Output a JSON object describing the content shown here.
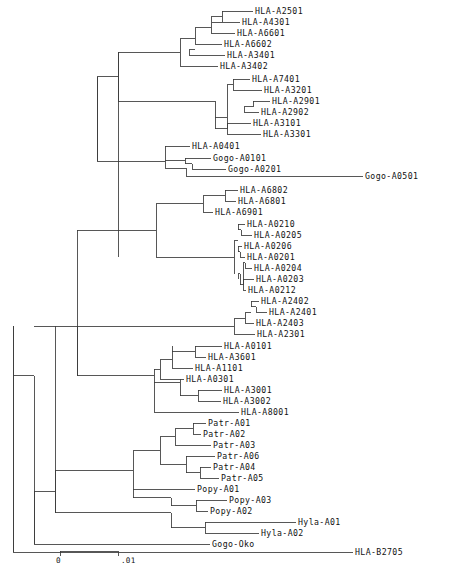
{
  "figure": {
    "type": "phylogenetic-tree",
    "title": "",
    "layout": "rectangular-cladogram",
    "orientation": "left-to-right",
    "line_color": "#3a3a3a",
    "text_color": "#111111",
    "background": "#ffffff",
    "width": 458,
    "height": 569
  },
  "scale_bar": {
    "start_label": "0",
    "end_label": ".01",
    "x_start": 60,
    "x_end": 118,
    "y": 551,
    "tick_height": 5
  },
  "tips": [
    {
      "label": "HLA-A2501",
      "x": 255,
      "y": 11
    },
    {
      "label": "HLA-A4301",
      "x": 242,
      "y": 22
    },
    {
      "label": "HLA-A6601",
      "x": 237,
      "y": 33
    },
    {
      "label": "HLA-A6602",
      "x": 224,
      "y": 44
    },
    {
      "label": "HLA-A3401",
      "x": 227,
      "y": 55
    },
    {
      "label": "HLA-A3402",
      "x": 220,
      "y": 66
    },
    {
      "label": "HLA-A7401",
      "x": 252,
      "y": 79
    },
    {
      "label": "HLA-A3201",
      "x": 264,
      "y": 90
    },
    {
      "label": "HLA-A2901",
      "x": 272,
      "y": 101
    },
    {
      "label": "HLA-A2902",
      "x": 261,
      "y": 112
    },
    {
      "label": "HLA-A3101",
      "x": 253,
      "y": 123
    },
    {
      "label": "HLA-A3301",
      "x": 263,
      "y": 134
    },
    {
      "label": "HLA-A0401",
      "x": 192,
      "y": 146
    },
    {
      "label": "Gogo-A0101",
      "x": 213,
      "y": 158
    },
    {
      "label": "Gogo-A0201",
      "x": 228,
      "y": 169
    },
    {
      "label": "Gogo-A0501",
      "x": 365,
      "y": 176
    },
    {
      "label": "HLA-A6802",
      "x": 240,
      "y": 190
    },
    {
      "label": "HLA-A6801",
      "x": 238,
      "y": 201
    },
    {
      "label": "HLA-A6901",
      "x": 215,
      "y": 212
    },
    {
      "label": "HLA-A0210",
      "x": 247,
      "y": 224
    },
    {
      "label": "HLA-A0205",
      "x": 254,
      "y": 235
    },
    {
      "label": "HLA-A0206",
      "x": 244,
      "y": 246
    },
    {
      "label": "HLA-A0201",
      "x": 247,
      "y": 257
    },
    {
      "label": "HLA-A0204",
      "x": 254,
      "y": 268
    },
    {
      "label": "HLA-A0203",
      "x": 256,
      "y": 279
    },
    {
      "label": "HLA-A0212",
      "x": 248,
      "y": 290
    },
    {
      "label": "HLA-A2402",
      "x": 261,
      "y": 301
    },
    {
      "label": "HLA-A2401",
      "x": 269,
      "y": 312
    },
    {
      "label": "HLA-A2403",
      "x": 256,
      "y": 323
    },
    {
      "label": "HLA-A2301",
      "x": 257,
      "y": 334
    },
    {
      "label": "HLA-A0101",
      "x": 224,
      "y": 346
    },
    {
      "label": "HLA-A3601",
      "x": 208,
      "y": 357
    },
    {
      "label": "HLA-A1101",
      "x": 195,
      "y": 368
    },
    {
      "label": "HLA-A0301",
      "x": 186,
      "y": 379
    },
    {
      "label": "HLA-A3001",
      "x": 224,
      "y": 390
    },
    {
      "label": "HLA-A3002",
      "x": 223,
      "y": 401
    },
    {
      "label": "HLA-A8001",
      "x": 241,
      "y": 412
    },
    {
      "label": "Patr-A01",
      "x": 208,
      "y": 423
    },
    {
      "label": "Patr-A02",
      "x": 203,
      "y": 434
    },
    {
      "label": "Patr-A03",
      "x": 213,
      "y": 445
    },
    {
      "label": "Patr-A06",
      "x": 217,
      "y": 456
    },
    {
      "label": "Patr-A04",
      "x": 213,
      "y": 467
    },
    {
      "label": "Patr-A05",
      "x": 221,
      "y": 478
    },
    {
      "label": "Popy-A01",
      "x": 197,
      "y": 489
    },
    {
      "label": "Popy-A03",
      "x": 229,
      "y": 500
    },
    {
      "label": "Popy-A02",
      "x": 210,
      "y": 511
    },
    {
      "label": "Hyla-A01",
      "x": 298,
      "y": 522
    },
    {
      "label": "Hyla-A02",
      "x": 261,
      "y": 533
    },
    {
      "label": "Gogo-Oko",
      "x": 212,
      "y": 544
    },
    {
      "label": "HLA-B2705",
      "x": 355,
      "y": 552
    }
  ],
  "branches": {
    "horizontal": [
      {
        "x1": 222,
        "x2": 253,
        "y": 11
      },
      {
        "x1": 212,
        "x2": 240,
        "y": 22
      },
      {
        "x1": 211,
        "x2": 235,
        "y": 33
      },
      {
        "x1": 195,
        "x2": 222,
        "y": 44
      },
      {
        "x1": 189,
        "x2": 225,
        "y": 55
      },
      {
        "x1": 180,
        "x2": 218,
        "y": 66
      },
      {
        "x1": 233,
        "x2": 250,
        "y": 79
      },
      {
        "x1": 233,
        "x2": 262,
        "y": 90
      },
      {
        "x1": 253,
        "x2": 270,
        "y": 101
      },
      {
        "x1": 244,
        "x2": 259,
        "y": 112
      },
      {
        "x1": 227,
        "x2": 251,
        "y": 123
      },
      {
        "x1": 227,
        "x2": 261,
        "y": 134
      },
      {
        "x1": 165,
        "x2": 190,
        "y": 146
      },
      {
        "x1": 185,
        "x2": 211,
        "y": 158
      },
      {
        "x1": 192,
        "x2": 226,
        "y": 169
      },
      {
        "x1": 186,
        "x2": 363,
        "y": 176
      },
      {
        "x1": 225,
        "x2": 238,
        "y": 190
      },
      {
        "x1": 225,
        "x2": 236,
        "y": 201
      },
      {
        "x1": 203,
        "x2": 213,
        "y": 212
      },
      {
        "x1": 238,
        "x2": 245,
        "y": 224
      },
      {
        "x1": 241,
        "x2": 252,
        "y": 235
      },
      {
        "x1": 238,
        "x2": 242,
        "y": 246
      },
      {
        "x1": 240,
        "x2": 245,
        "y": 257
      },
      {
        "x1": 245,
        "x2": 252,
        "y": 268
      },
      {
        "x1": 243,
        "x2": 254,
        "y": 279
      },
      {
        "x1": 243,
        "x2": 246,
        "y": 290
      },
      {
        "x1": 251,
        "x2": 259,
        "y": 301
      },
      {
        "x1": 256,
        "x2": 267,
        "y": 312
      },
      {
        "x1": 245,
        "x2": 254,
        "y": 323
      },
      {
        "x1": 234,
        "x2": 255,
        "y": 334
      },
      {
        "x1": 195,
        "x2": 222,
        "y": 346
      },
      {
        "x1": 195,
        "x2": 206,
        "y": 357
      },
      {
        "x1": 172,
        "x2": 193,
        "y": 368
      },
      {
        "x1": 160,
        "x2": 184,
        "y": 379
      },
      {
        "x1": 198,
        "x2": 222,
        "y": 390
      },
      {
        "x1": 198,
        "x2": 221,
        "y": 401
      },
      {
        "x1": 154,
        "x2": 239,
        "y": 412
      },
      {
        "x1": 193,
        "x2": 206,
        "y": 423
      },
      {
        "x1": 193,
        "x2": 201,
        "y": 434
      },
      {
        "x1": 175,
        "x2": 211,
        "y": 445
      },
      {
        "x1": 186,
        "x2": 215,
        "y": 456
      },
      {
        "x1": 200,
        "x2": 211,
        "y": 467
      },
      {
        "x1": 200,
        "x2": 219,
        "y": 478
      },
      {
        "x1": 133,
        "x2": 195,
        "y": 489
      },
      {
        "x1": 196,
        "x2": 227,
        "y": 500
      },
      {
        "x1": 196,
        "x2": 208,
        "y": 511
      },
      {
        "x1": 205,
        "x2": 296,
        "y": 522
      },
      {
        "x1": 205,
        "x2": 259,
        "y": 533
      },
      {
        "x1": 34,
        "x2": 210,
        "y": 544
      },
      {
        "x1": 13,
        "x2": 353,
        "y": 552
      },
      {
        "x1": 211,
        "x2": 222,
        "y": 16.5
      },
      {
        "x1": 195,
        "x2": 211,
        "y": 27.5
      },
      {
        "x1": 180,
        "x2": 195,
        "y": 38.5
      },
      {
        "x1": 189,
        "x2": 195,
        "y": 49.5
      },
      {
        "x1": 118,
        "x2": 180,
        "y": 52.25
      },
      {
        "x1": 227,
        "x2": 233,
        "y": 84.5
      },
      {
        "x1": 244,
        "x2": 253,
        "y": 106.5
      },
      {
        "x1": 215,
        "x2": 227,
        "y": 128.5
      },
      {
        "x1": 215,
        "x2": 227,
        "y": 117.5
      },
      {
        "x1": 118,
        "x2": 215,
        "y": 101.0
      },
      {
        "x1": 97,
        "x2": 118,
        "y": 76.6
      },
      {
        "x1": 185,
        "x2": 192,
        "y": 163.5
      },
      {
        "x1": 165,
        "x2": 185,
        "y": 160.75
      },
      {
        "x1": 165,
        "x2": 186,
        "y": 168.4
      },
      {
        "x1": 97,
        "x2": 165,
        "y": 161.0
      },
      {
        "x1": 203,
        "x2": 225,
        "y": 195.5
      },
      {
        "x1": 156,
        "x2": 203,
        "y": 203.75
      },
      {
        "x1": 238,
        "x2": 241,
        "y": 229.5
      },
      {
        "x1": 238,
        "x2": 240,
        "y": 251.5
      },
      {
        "x1": 243,
        "x2": 245,
        "y": 262.5
      },
      {
        "x1": 240,
        "x2": 243,
        "y": 284.5
      },
      {
        "x1": 238,
        "x2": 240,
        "y": 273.5
      },
      {
        "x1": 234,
        "x2": 238,
        "y": 240.5
      },
      {
        "x1": 156,
        "x2": 234,
        "y": 257.0
      },
      {
        "x1": 118,
        "x2": 156,
        "y": 230.4
      },
      {
        "x1": 251,
        "x2": 256,
        "y": 306.5
      },
      {
        "x1": 245,
        "x2": 251,
        "y": 312.75
      },
      {
        "x1": 234,
        "x2": 245,
        "y": 318.9
      },
      {
        "x1": 77,
        "x2": 234,
        "y": 326.4
      },
      {
        "x1": 172,
        "x2": 195,
        "y": 351.5
      },
      {
        "x1": 160,
        "x2": 172,
        "y": 359.75
      },
      {
        "x1": 154,
        "x2": 160,
        "y": 369.4
      },
      {
        "x1": 180,
        "x2": 198,
        "y": 395.5
      },
      {
        "x1": 154,
        "x2": 180,
        "y": 382.4
      },
      {
        "x1": 77,
        "x2": 154,
        "y": 375.9
      },
      {
        "x1": 175,
        "x2": 193,
        "y": 428.5
      },
      {
        "x1": 160,
        "x2": 175,
        "y": 436.75
      },
      {
        "x1": 186,
        "x2": 200,
        "y": 472.5
      },
      {
        "x1": 160,
        "x2": 186,
        "y": 464.25
      },
      {
        "x1": 133,
        "x2": 160,
        "y": 450.5
      },
      {
        "x1": 55,
        "x2": 133,
        "y": 470.0
      },
      {
        "x1": 171,
        "x2": 196,
        "y": 505.5
      },
      {
        "x1": 133,
        "x2": 171,
        "y": 497.5
      },
      {
        "x1": 171,
        "x2": 205,
        "y": 527.5
      },
      {
        "x1": 55,
        "x2": 171,
        "y": 512.5
      },
      {
        "x1": 34,
        "x2": 55,
        "y": 491.25
      }
    ],
    "vertical": [
      {
        "x": 222,
        "y1": 11,
        "y2": 22
      },
      {
        "x": 211,
        "y1": 16.5,
        "y2": 33
      },
      {
        "x": 195,
        "y1": 27.5,
        "y2": 44
      },
      {
        "x": 189,
        "y1": 49.5,
        "y2": 55
      },
      {
        "x": 180,
        "y1": 38.5,
        "y2": 66
      },
      {
        "x": 233,
        "y1": 79,
        "y2": 90
      },
      {
        "x": 253,
        "y1": 101,
        "y2": 106.5
      },
      {
        "x": 244,
        "y1": 106.5,
        "y2": 112
      },
      {
        "x": 227,
        "y1": 84.5,
        "y2": 128.5
      },
      {
        "x": 227,
        "y1": 123,
        "y2": 134
      },
      {
        "x": 215,
        "y1": 101.0,
        "y2": 128.5
      },
      {
        "x": 118,
        "y1": 52.25,
        "y2": 101.0
      },
      {
        "x": 185,
        "y1": 158,
        "y2": 163.5
      },
      {
        "x": 192,
        "y1": 163.5,
        "y2": 169
      },
      {
        "x": 186,
        "y1": 168.4,
        "y2": 176
      },
      {
        "x": 165,
        "y1": 146,
        "y2": 168.4
      },
      {
        "x": 97,
        "y1": 76.6,
        "y2": 161.0
      },
      {
        "x": 225,
        "y1": 190,
        "y2": 201
      },
      {
        "x": 203,
        "y1": 195.5,
        "y2": 212
      },
      {
        "x": 238,
        "y1": 224,
        "y2": 229.5
      },
      {
        "x": 241,
        "y1": 229.5,
        "y2": 235
      },
      {
        "x": 238,
        "y1": 246,
        "y2": 251.5
      },
      {
        "x": 240,
        "y1": 251.5,
        "y2": 257
      },
      {
        "x": 243,
        "y1": 262.5,
        "y2": 284.5
      },
      {
        "x": 245,
        "y1": 262.5,
        "y2": 268
      },
      {
        "x": 240,
        "y1": 273.5,
        "y2": 284.5
      },
      {
        "x": 243,
        "y1": 279,
        "y2": 290
      },
      {
        "x": 238,
        "y1": 273.5,
        "y2": 279
      },
      {
        "x": 234,
        "y1": 240.5,
        "y2": 273.5
      },
      {
        "x": 156,
        "y1": 203.75,
        "y2": 257.0
      },
      {
        "x": 118,
        "y1": 230.4,
        "y2": 257.0
      },
      {
        "x": 251,
        "y1": 301,
        "y2": 306.5
      },
      {
        "x": 256,
        "y1": 306.5,
        "y2": 312
      },
      {
        "x": 245,
        "y1": 312.75,
        "y2": 323
      },
      {
        "x": 234,
        "y1": 318.9,
        "y2": 334
      },
      {
        "x": 172,
        "y1": 346,
        "y2": 368
      },
      {
        "x": 195,
        "y1": 346,
        "y2": 357
      },
      {
        "x": 160,
        "y1": 359.75,
        "y2": 379
      },
      {
        "x": 198,
        "y1": 390,
        "y2": 401
      },
      {
        "x": 180,
        "y1": 379,
        "y2": 395.5
      },
      {
        "x": 154,
        "y1": 369.4,
        "y2": 412
      },
      {
        "x": 77,
        "y1": 326.4,
        "y2": 375.9
      },
      {
        "x": 193,
        "y1": 423,
        "y2": 434
      },
      {
        "x": 175,
        "y1": 428.5,
        "y2": 445
      },
      {
        "x": 200,
        "y1": 467,
        "y2": 478
      },
      {
        "x": 186,
        "y1": 456,
        "y2": 472.5
      },
      {
        "x": 160,
        "y1": 436.75,
        "y2": 464.25
      },
      {
        "x": 133,
        "y1": 450.5,
        "y2": 489
      },
      {
        "x": 196,
        "y1": 500,
        "y2": 511
      },
      {
        "x": 171,
        "y1": 497.5,
        "y2": 505.5
      },
      {
        "x": 133,
        "y1": 489,
        "y2": 497.5
      },
      {
        "x": 205,
        "y1": 522,
        "y2": 533
      },
      {
        "x": 171,
        "y1": 512.5,
        "y2": 527.5
      },
      {
        "x": 55,
        "y1": 470.0,
        "y2": 512.5
      },
      {
        "x": 34,
        "y1": 491.25,
        "y2": 544
      },
      {
        "x": 13,
        "y1": 326.4,
        "y2": 552
      },
      {
        "x": 13,
        "y1": 326.4,
        "y2": 552
      },
      {
        "x": 34,
        "y1": 375.9,
        "y2": 544
      },
      {
        "x": 55,
        "y1": 326.4,
        "y2": 512.5
      },
      {
        "x": 77,
        "y1": 230.4,
        "y2": 375.9
      },
      {
        "x": 97,
        "y1": 76.6,
        "y2": 161.0
      },
      {
        "x": 118,
        "y1": 52.25,
        "y2": 230.4
      }
    ],
    "backbone_connectors": [
      {
        "x1": 13,
        "x2": 34,
        "y": 375.9
      },
      {
        "x1": 34,
        "x2": 55,
        "y": 326.4
      },
      {
        "x1": 55,
        "x2": 77,
        "y": 326.4
      },
      {
        "x1": 77,
        "x2": 97,
        "y": 230.4
      },
      {
        "x1": 97,
        "x2": 118,
        "y": 230.4
      }
    ]
  }
}
